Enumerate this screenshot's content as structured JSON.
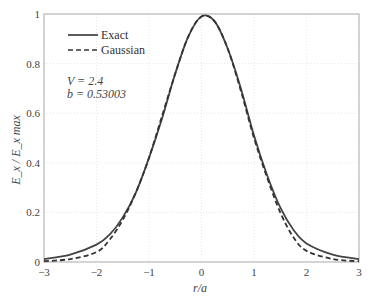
{
  "chart_data": {
    "type": "line",
    "title": "",
    "xlabel": "r/a",
    "ylabel": "E_x / E_x max",
    "xlim": [
      -3,
      3
    ],
    "ylim": [
      0,
      1
    ],
    "xticks": [
      -3,
      -2,
      -1,
      0,
      1,
      2,
      3
    ],
    "yticks": [
      0,
      0.2,
      0.4,
      0.6,
      0.8,
      1
    ],
    "ytick_labels": [
      "0",
      "0.2",
      "0.4",
      "0.6",
      "0.8",
      "1"
    ],
    "grid": true,
    "legend_position": "upper left",
    "annotations": [
      "V = 2.4",
      "b = 0.53003"
    ],
    "x": [
      -3,
      -2.5,
      -2,
      -1.75,
      -1.5,
      -1.25,
      -1,
      -0.75,
      -0.5,
      -0.25,
      0,
      0.25,
      0.5,
      0.75,
      1,
      1.25,
      1.5,
      1.75,
      2,
      2.5,
      3
    ],
    "series": [
      {
        "name": "Exact",
        "style": "solid",
        "values": [
          0.012,
          0.03,
          0.07,
          0.11,
          0.18,
          0.28,
          0.42,
          0.58,
          0.76,
          0.91,
          0.99,
          0.97,
          0.86,
          0.7,
          0.51,
          0.35,
          0.22,
          0.13,
          0.075,
          0.03,
          0.012
        ]
      },
      {
        "name": "Gaussian",
        "style": "dashed",
        "values": [
          0.003,
          0.012,
          0.04,
          0.09,
          0.17,
          0.28,
          0.42,
          0.59,
          0.76,
          0.91,
          0.99,
          0.97,
          0.86,
          0.69,
          0.5,
          0.34,
          0.2,
          0.1,
          0.045,
          0.012,
          0.003
        ]
      }
    ]
  },
  "legend": {
    "exact": "Exact",
    "gaussian": "Gaussian"
  },
  "annotation": {
    "v": "V = 2.4",
    "b": "b = 0.53003"
  },
  "axes": {
    "xlabel": "r/a",
    "ylabel": "E_x / E_x max"
  }
}
